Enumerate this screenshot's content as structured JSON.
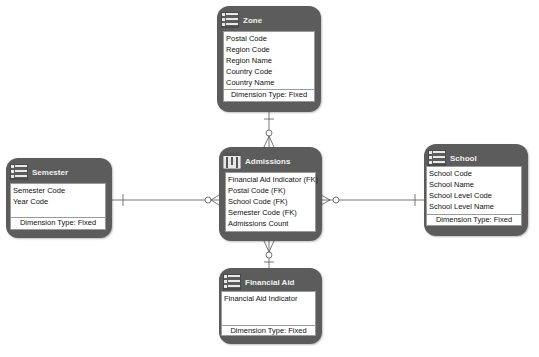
{
  "diagram": {
    "entities": {
      "zone": {
        "title": "Zone",
        "icon": "dimension-table-icon",
        "attributes": [
          "Postal Code",
          "Region Code",
          "Region Name",
          "Country Code",
          "Country Name"
        ],
        "footer": "Dimension Type: Fixed"
      },
      "admissions": {
        "title": "Admissions",
        "icon": "fact-table-icon",
        "attributes": [
          "Financial Aid Indicator (FK)",
          "Postal Code (FK)",
          "School Code (FK)",
          "Semester Code (FK)",
          "Admissions Count"
        ]
      },
      "semester": {
        "title": "Semester",
        "icon": "dimension-table-icon",
        "attributes": [
          "Semester Code",
          "Year Code"
        ],
        "footer": "Dimension Type: Fixed"
      },
      "school": {
        "title": "School",
        "icon": "dimension-table-icon",
        "attributes": [
          "School Code",
          "School Name",
          "School Level Code",
          "School Level Name"
        ],
        "footer": "Dimension Type: Fixed"
      },
      "financial_aid": {
        "title": "Financial Aid",
        "icon": "dimension-table-icon",
        "attributes": [
          "Financial Aid Indicator"
        ],
        "footer": "Dimension Type: Fixed"
      }
    },
    "relationships": [
      {
        "from": "Zone",
        "to": "Admissions",
        "cardinality": "one-to-zero-or-many"
      },
      {
        "from": "Semester",
        "to": "Admissions",
        "cardinality": "one-to-zero-or-many"
      },
      {
        "from": "School",
        "to": "Admissions",
        "cardinality": "one-to-zero-or-many"
      },
      {
        "from": "Financial Aid",
        "to": "Admissions",
        "cardinality": "one-to-zero-or-many"
      }
    ],
    "colors": {
      "entity_fill": "#5c5c5c",
      "body_fill": "#ffffff",
      "line": "#555555"
    }
  }
}
